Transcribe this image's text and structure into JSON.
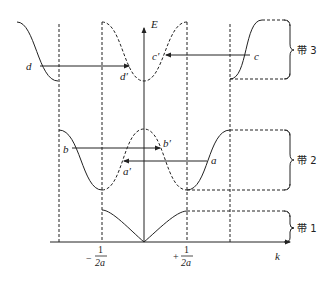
{
  "diagram": {
    "type": "extended-zone energy band diagram (reduction to first Brillouin zone)",
    "axes": {
      "y_label": "E",
      "x_label": "k",
      "tick_left": {
        "sign": "−",
        "numerator": "1",
        "denominator": "2a"
      },
      "tick_right": {
        "sign": "+",
        "numerator": "1",
        "denominator": "2a"
      }
    },
    "bands": [
      {
        "id": "band1",
        "label": "带 1"
      },
      {
        "id": "band2",
        "label": "带 2"
      },
      {
        "id": "band3",
        "label": "带 3"
      }
    ],
    "points": {
      "a": "a",
      "a_prime": "a′",
      "b": "b",
      "b_prime": "b′",
      "c": "c",
      "c_prime": "c′",
      "d": "d",
      "d_prime": "d′"
    }
  }
}
